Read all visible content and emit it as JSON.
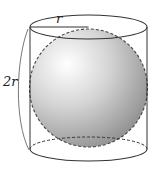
{
  "diagram": {
    "labels": {
      "radius": "r",
      "height": "2r"
    },
    "colors": {
      "stroke": "#333333",
      "sphere_light": "#ffffff",
      "sphere_dark": "#8a8a8a",
      "background": "#ffffff"
    }
  }
}
